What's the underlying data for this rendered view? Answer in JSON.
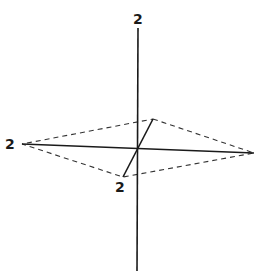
{
  "diagram": {
    "type": "3d-axes-octahedron-section",
    "labels": {
      "top": "2",
      "left": "2",
      "front": "2"
    },
    "colors": {
      "line": "#1a1a1a",
      "dashed": "#333333",
      "background": "#ffffff"
    }
  }
}
